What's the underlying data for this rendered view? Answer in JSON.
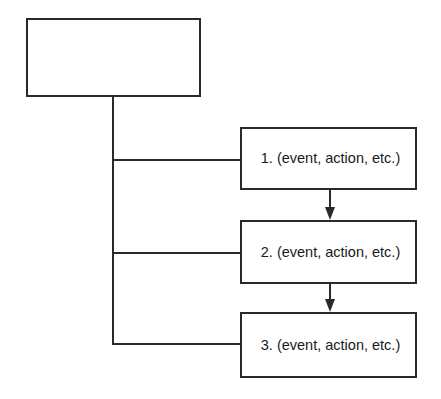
{
  "diagram": {
    "root": {
      "label": ""
    },
    "steps": [
      {
        "label": "1. (event, action, etc.)"
      },
      {
        "label": "2. (event, action, etc.)"
      },
      {
        "label": "3. (event, action, etc.)"
      }
    ],
    "colors": {
      "stroke": "#2a2a2a",
      "background": "#ffffff"
    }
  }
}
